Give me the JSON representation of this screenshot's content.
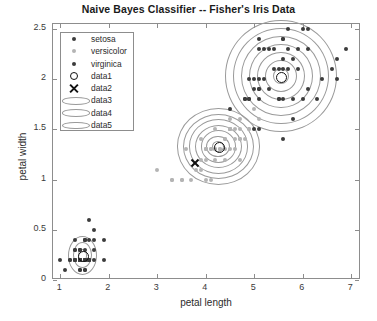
{
  "chart_data": {
    "type": "scatter",
    "title": "Naive Bayes Classifier -- Fisher's Iris Data",
    "xlabel": "petal length",
    "ylabel": "petal width",
    "xlim": [
      0.85,
      7.2
    ],
    "ylim": [
      0,
      2.55
    ],
    "xticks": [
      1,
      2,
      3,
      4,
      5,
      6,
      7
    ],
    "xticklabels": [
      "1",
      "2",
      "3",
      "4",
      "5",
      "6",
      "7"
    ],
    "yticks": [
      0,
      0.5,
      1,
      1.5,
      2,
      2.5
    ],
    "yticklabels": [
      "0",
      "0.5",
      "1",
      "1.5",
      "2",
      "2.5"
    ],
    "grid": false,
    "legend_position": "north-west",
    "legend_entries": [
      {
        "label": "setosa",
        "marker": "filled-circle",
        "color": "#3c3c3c"
      },
      {
        "label": "versicolor",
        "marker": "filled-circle",
        "color": "#b4b4b4"
      },
      {
        "label": "virginica",
        "marker": "filled-circle",
        "color": "#3c3c3c"
      },
      {
        "label": "data1",
        "marker": "open-circle",
        "color": "#111111"
      },
      {
        "label": "data2",
        "marker": "cross-x",
        "color": "#111111"
      },
      {
        "label": "data3",
        "marker": "ellipse-contour",
        "color": "#9a9a9a"
      },
      {
        "label": "data4",
        "marker": "ellipse-contour",
        "color": "#9a9a9a"
      },
      {
        "label": "data5",
        "marker": "ellipse-contour",
        "color": "#9a9a9a"
      }
    ],
    "series": [
      {
        "name": "setosa",
        "color": "#3c3c3c",
        "points": [
          [
            1.4,
            0.2
          ],
          [
            1.4,
            0.2
          ],
          [
            1.3,
            0.2
          ],
          [
            1.5,
            0.2
          ],
          [
            1.4,
            0.2
          ],
          [
            1.7,
            0.4
          ],
          [
            1.4,
            0.3
          ],
          [
            1.5,
            0.2
          ],
          [
            1.4,
            0.2
          ],
          [
            1.5,
            0.1
          ],
          [
            1.5,
            0.2
          ],
          [
            1.6,
            0.2
          ],
          [
            1.4,
            0.1
          ],
          [
            1.1,
            0.1
          ],
          [
            1.2,
            0.2
          ],
          [
            1.5,
            0.4
          ],
          [
            1.3,
            0.4
          ],
          [
            1.4,
            0.3
          ],
          [
            1.7,
            0.3
          ],
          [
            1.5,
            0.3
          ],
          [
            1.7,
            0.2
          ],
          [
            1.5,
            0.4
          ],
          [
            1.0,
            0.2
          ],
          [
            1.7,
            0.5
          ],
          [
            1.9,
            0.2
          ],
          [
            1.6,
            0.2
          ],
          [
            1.6,
            0.4
          ],
          [
            1.5,
            0.2
          ],
          [
            1.4,
            0.2
          ],
          [
            1.6,
            0.2
          ],
          [
            1.6,
            0.2
          ],
          [
            1.5,
            0.4
          ],
          [
            1.5,
            0.1
          ],
          [
            1.4,
            0.2
          ],
          [
            1.5,
            0.2
          ],
          [
            1.2,
            0.2
          ],
          [
            1.3,
            0.2
          ],
          [
            1.4,
            0.1
          ],
          [
            1.3,
            0.2
          ],
          [
            1.5,
            0.2
          ],
          [
            1.3,
            0.3
          ],
          [
            1.3,
            0.3
          ],
          [
            1.3,
            0.2
          ],
          [
            1.6,
            0.6
          ],
          [
            1.9,
            0.4
          ],
          [
            1.4,
            0.3
          ],
          [
            1.6,
            0.2
          ],
          [
            1.4,
            0.2
          ],
          [
            1.5,
            0.2
          ],
          [
            1.4,
            0.2
          ]
        ]
      },
      {
        "name": "versicolor",
        "color": "#b4b4b4",
        "points": [
          [
            4.7,
            1.4
          ],
          [
            4.5,
            1.5
          ],
          [
            4.9,
            1.5
          ],
          [
            4.0,
            1.3
          ],
          [
            4.6,
            1.5
          ],
          [
            4.5,
            1.3
          ],
          [
            4.7,
            1.6
          ],
          [
            3.3,
            1.0
          ],
          [
            4.6,
            1.3
          ],
          [
            3.9,
            1.4
          ],
          [
            3.5,
            1.0
          ],
          [
            4.2,
            1.5
          ],
          [
            4.0,
            1.0
          ],
          [
            4.7,
            1.4
          ],
          [
            3.6,
            1.3
          ],
          [
            4.4,
            1.4
          ],
          [
            4.5,
            1.5
          ],
          [
            4.1,
            1.0
          ],
          [
            4.5,
            1.5
          ],
          [
            3.9,
            1.1
          ],
          [
            4.8,
            1.8
          ],
          [
            4.0,
            1.3
          ],
          [
            4.9,
            1.5
          ],
          [
            4.7,
            1.2
          ],
          [
            4.3,
            1.3
          ],
          [
            4.4,
            1.4
          ],
          [
            4.8,
            1.4
          ],
          [
            5.0,
            1.7
          ],
          [
            4.5,
            1.5
          ],
          [
            3.5,
            1.0
          ],
          [
            3.8,
            1.1
          ],
          [
            3.7,
            1.0
          ],
          [
            3.9,
            1.2
          ],
          [
            5.1,
            1.6
          ],
          [
            4.5,
            1.5
          ],
          [
            4.5,
            1.6
          ],
          [
            4.7,
            1.5
          ],
          [
            4.4,
            1.3
          ],
          [
            4.1,
            1.3
          ],
          [
            4.0,
            1.3
          ],
          [
            4.4,
            1.2
          ],
          [
            4.6,
            1.4
          ],
          [
            4.0,
            1.2
          ],
          [
            3.3,
            1.0
          ],
          [
            4.2,
            1.3
          ],
          [
            4.2,
            1.2
          ],
          [
            4.2,
            1.3
          ],
          [
            4.3,
            1.3
          ],
          [
            3.0,
            1.1
          ],
          [
            4.1,
            1.3
          ]
        ]
      },
      {
        "name": "virginica",
        "color": "#3c3c3c",
        "points": [
          [
            6.0,
            2.5
          ],
          [
            5.1,
            1.9
          ],
          [
            5.9,
            2.1
          ],
          [
            5.6,
            1.8
          ],
          [
            5.8,
            2.2
          ],
          [
            6.6,
            2.1
          ],
          [
            4.5,
            1.7
          ],
          [
            6.3,
            1.8
          ],
          [
            5.8,
            1.8
          ],
          [
            6.1,
            2.5
          ],
          [
            5.1,
            2.0
          ],
          [
            5.3,
            1.9
          ],
          [
            5.5,
            2.1
          ],
          [
            5.0,
            2.0
          ],
          [
            5.1,
            2.4
          ],
          [
            5.3,
            2.3
          ],
          [
            5.5,
            1.8
          ],
          [
            6.7,
            2.2
          ],
          [
            6.9,
            2.3
          ],
          [
            5.0,
            1.5
          ],
          [
            5.7,
            2.3
          ],
          [
            4.9,
            2.0
          ],
          [
            6.7,
            2.0
          ],
          [
            4.9,
            1.8
          ],
          [
            5.7,
            2.1
          ],
          [
            6.0,
            1.8
          ],
          [
            4.8,
            1.8
          ],
          [
            4.9,
            1.8
          ],
          [
            5.6,
            2.1
          ],
          [
            5.8,
            1.6
          ],
          [
            6.1,
            1.9
          ],
          [
            6.4,
            2.0
          ],
          [
            5.6,
            2.2
          ],
          [
            5.1,
            1.5
          ],
          [
            5.6,
            1.4
          ],
          [
            6.1,
            2.3
          ],
          [
            5.6,
            2.4
          ],
          [
            5.5,
            1.8
          ],
          [
            4.8,
            1.8
          ],
          [
            5.4,
            2.1
          ],
          [
            5.6,
            2.4
          ],
          [
            5.1,
            2.3
          ],
          [
            5.1,
            1.9
          ],
          [
            5.9,
            2.3
          ],
          [
            5.7,
            2.5
          ],
          [
            5.2,
            2.3
          ],
          [
            5.0,
            1.9
          ],
          [
            5.2,
            2.0
          ],
          [
            5.4,
            2.3
          ],
          [
            5.1,
            1.8
          ]
        ]
      }
    ],
    "centroids": [
      {
        "name": "setosa-centroid",
        "x": 1.46,
        "y": 0.245
      },
      {
        "name": "versicolor-centroid",
        "x": 4.26,
        "y": 1.33
      },
      {
        "name": "virginica-centroid",
        "x": 5.55,
        "y": 2.03
      }
    ],
    "markers": [
      {
        "name": "query-point-x",
        "x": 3.78,
        "y": 1.17,
        "marker": "cross-x"
      }
    ],
    "contours": [
      {
        "name": "setosa-contours",
        "cx": 1.46,
        "cy": 0.245,
        "rx": 0.3,
        "ry": 0.195,
        "levels": 3
      },
      {
        "name": "versicolor-contours",
        "cx": 4.26,
        "cy": 1.33,
        "rx": 0.86,
        "ry": 0.38,
        "levels": 7
      },
      {
        "name": "virginica-contours",
        "cx": 5.55,
        "cy": 2.03,
        "rx": 1.15,
        "ry": 0.56,
        "levels": 7
      }
    ]
  }
}
